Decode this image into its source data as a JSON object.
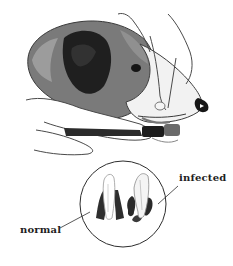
{
  "figure": {
    "labels": {
      "infected": "infected",
      "normal": "normal"
    },
    "inset": {
      "shape": "circle",
      "items": [
        "normal tooth",
        "infected tooth"
      ]
    },
    "colors": {
      "background": "#ffffff",
      "ink": "#1e1e1e",
      "fur_dark": "#2a2a2a",
      "fur_mid": "#6e6e6e",
      "fur_light": "#a8a8a8",
      "line": "#444444"
    }
  }
}
